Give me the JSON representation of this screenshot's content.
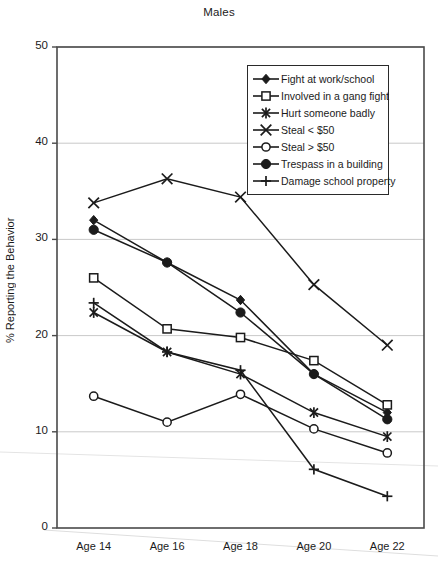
{
  "chart_data": {
    "type": "line",
    "title": "Males",
    "xlabel": "",
    "ylabel": "% Reporting the Behavior",
    "categories": [
      "Age 14",
      "Age 16",
      "Age 18",
      "Age 20",
      "Age 22"
    ],
    "ylim": [
      0,
      50
    ],
    "ytick_labels": [
      "0",
      "10",
      "20",
      "30",
      "40",
      "50"
    ],
    "ytick_values": [
      0,
      10,
      20,
      30,
      40,
      50
    ],
    "grid": "horizontal",
    "legend_position": "upper-right-inside",
    "series": [
      {
        "name": "Fight at work/school",
        "marker": "filled-diamond",
        "values": [
          32.0,
          27.6,
          23.7,
          16.0,
          12.0
        ]
      },
      {
        "name": "Involved in a gang fight",
        "marker": "open-square",
        "values": [
          26.0,
          20.7,
          19.8,
          17.4,
          12.8
        ]
      },
      {
        "name": "Hurt someone badly",
        "marker": "asterisk-x",
        "values": [
          22.4,
          18.3,
          16.0,
          12.0,
          9.5
        ]
      },
      {
        "name": "Steal < $50",
        "marker": "cross-x",
        "values": [
          33.8,
          36.3,
          34.4,
          25.3,
          19.0
        ]
      },
      {
        "name": "Steal > $50",
        "marker": "open-circle",
        "values": [
          13.7,
          11.0,
          13.9,
          10.3,
          7.8
        ]
      },
      {
        "name": "Trespass in a building",
        "marker": "filled-circle",
        "values": [
          31.0,
          27.6,
          22.4,
          16.0,
          11.3
        ]
      },
      {
        "name": "Damage school property",
        "marker": "plus",
        "values": [
          23.4,
          18.3,
          16.4,
          6.1,
          3.3
        ]
      }
    ]
  },
  "legend": {
    "items": [
      {
        "label": "Fight at work/school",
        "marker": "filled-diamond"
      },
      {
        "label": "Involved in a gang fight",
        "marker": "open-square"
      },
      {
        "label": "Hurt someone badly",
        "marker": "asterisk-x"
      },
      {
        "label": "Steal < $50",
        "marker": "cross-x"
      },
      {
        "label": "Steal > $50",
        "marker": "open-circle"
      },
      {
        "label": "Trespass in a building",
        "marker": "filled-circle"
      },
      {
        "label": "Damage school property",
        "marker": "plus"
      }
    ]
  },
  "colors": {
    "line": "#1b1b1b",
    "grid": "#c9c9c9",
    "axis": "#4a4a4a",
    "text": "#1b1b1b",
    "background": "#ffffff"
  }
}
